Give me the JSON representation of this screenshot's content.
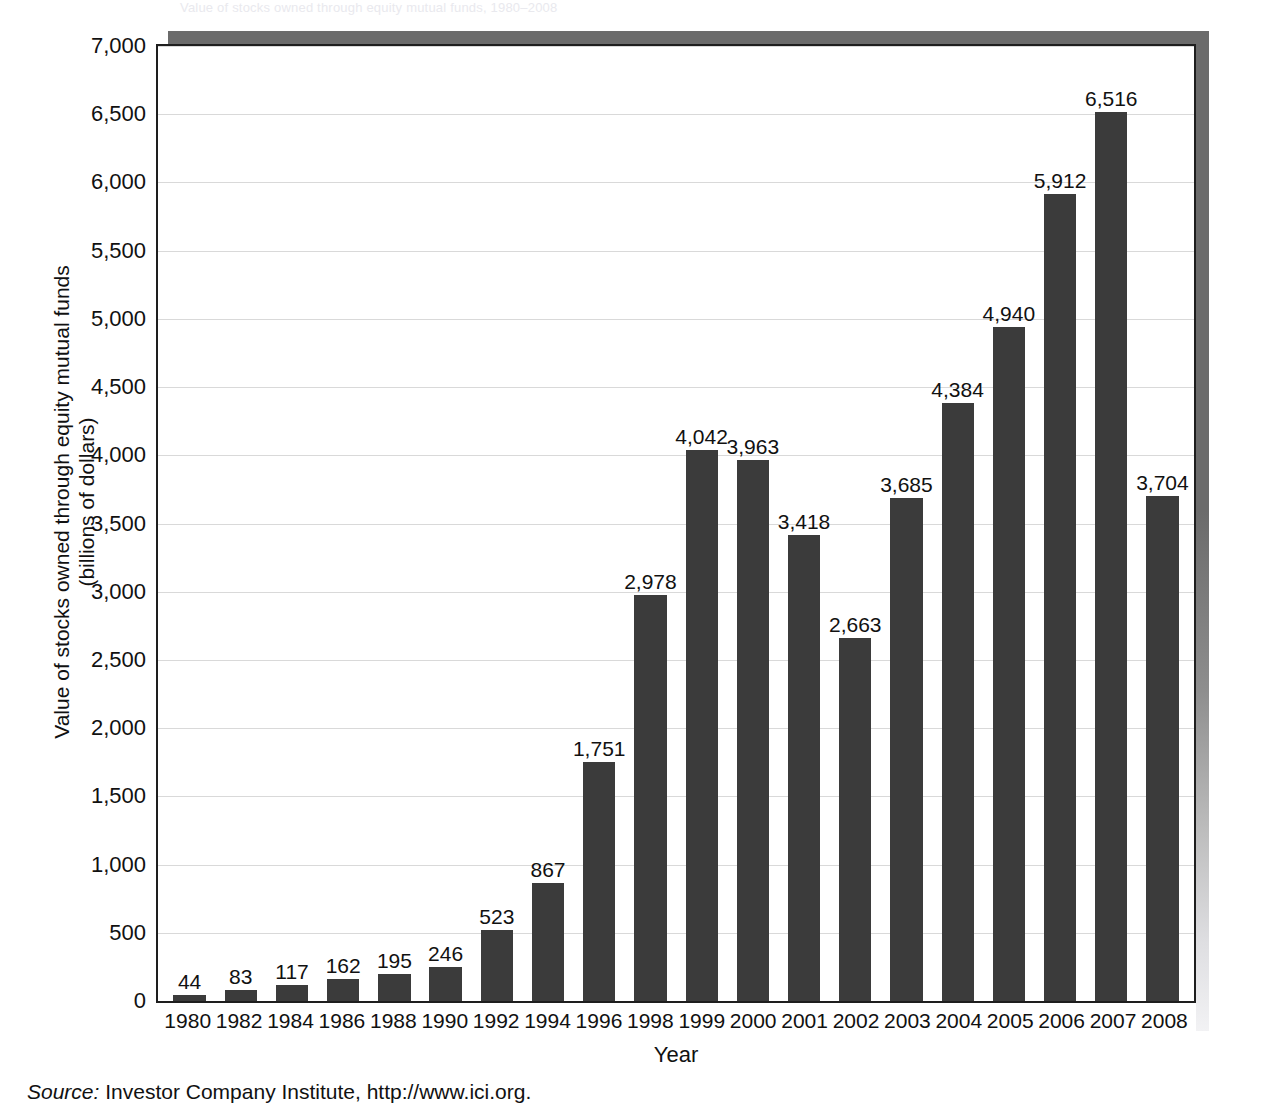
{
  "top_clip_text": "Value of stocks owned through equity mutual funds, 1980–2008",
  "axes": {
    "ylabel_line1": "Value of stocks owned through equity mutual funds",
    "ylabel_line2": "(billions of dollars)",
    "xlabel": "Year",
    "yticks": [
      "7,000",
      "6,500",
      "6,000",
      "5,500",
      "5,000",
      "4,500",
      "4,000",
      "3,500",
      "3,000",
      "2,500",
      "2,000",
      "1,500",
      "1,000",
      "500",
      "0"
    ],
    "ytick_values": [
      7000,
      6500,
      6000,
      5500,
      5000,
      4500,
      4000,
      3500,
      3000,
      2500,
      2000,
      1500,
      1000,
      500,
      0
    ]
  },
  "source": {
    "prefix": "Source:",
    "text": "Investor Company Institute, http://www.ici.org."
  },
  "colors": {
    "bar": "#3b3b3b",
    "axis": "#1e1e1e",
    "grid": "#d9d9d9",
    "shadow": "#6b6b6b",
    "text": "#111111",
    "plot_background": "#ffffff"
  },
  "chart_data": {
    "type": "bar",
    "title": "",
    "xlabel": "Year",
    "ylabel": "Value of stocks owned through equity mutual funds (billions of dollars)",
    "ylim": [
      0,
      7000
    ],
    "ytick_step": 500,
    "grid": true,
    "legend": "none",
    "data_labels": true,
    "categories": [
      "1980",
      "1982",
      "1984",
      "1986",
      "1988",
      "1990",
      "1992",
      "1994",
      "1996",
      "1998",
      "1999",
      "2000",
      "2001",
      "2002",
      "2003",
      "2004",
      "2005",
      "2006",
      "2007",
      "2008"
    ],
    "values": [
      44,
      83,
      117,
      162,
      195,
      246,
      523,
      867,
      1751,
      2978,
      4042,
      3963,
      3418,
      2663,
      3685,
      4384,
      4940,
      5912,
      6516,
      3704
    ],
    "labels": [
      "44",
      "83",
      "117",
      "162",
      "195",
      "246",
      "523",
      "867",
      "1,751",
      "2,978",
      "4,042",
      "3,963",
      "3,418",
      "2,663",
      "3,685",
      "4,384",
      "4,940",
      "5,912",
      "6,516",
      "3,704"
    ]
  }
}
